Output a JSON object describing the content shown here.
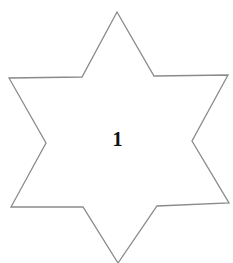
{
  "diagram": {
    "shape": "six-pointed-star",
    "label": "1",
    "stroke_color": "#8a8a8a",
    "fill_color": "#ffffff",
    "text_color": "#111111"
  }
}
